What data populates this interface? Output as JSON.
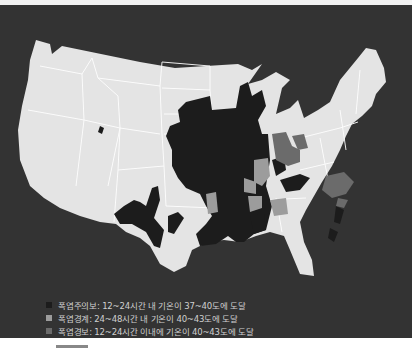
{
  "map": {
    "subject": "United States heat alert map",
    "colors": {
      "background": "#333333",
      "land": "#e4e4e4",
      "state_border": "#ffffff",
      "advisory": "#1c1c1c",
      "watch": "#9c9c9c",
      "warning": "#6b6b6b"
    }
  },
  "legend": {
    "items": [
      {
        "label": "폭염주의보: 12~24시간 내 기온이 37~40도에 도달",
        "color": "#1c1c1c"
      },
      {
        "label": "폭염경계: 24~48시간 내 기온이 40~43도에 도달",
        "color": "#9c9c9c"
      },
      {
        "label": "폭염경보: 12~24시간 이내에 기온이 40~43도에 도달",
        "color": "#6b6b6b"
      }
    ]
  },
  "caption": {
    "text": ""
  }
}
